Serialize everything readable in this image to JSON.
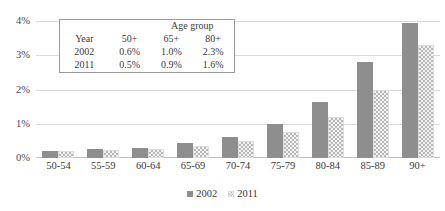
{
  "chart_data": {
    "type": "bar",
    "title": "",
    "xlabel": "",
    "ylabel": "",
    "ylim": [
      0,
      4
    ],
    "ytick_labels": [
      "4%",
      "3%",
      "2%",
      "1%",
      "0%"
    ],
    "ytick_values": [
      4,
      3,
      2,
      1,
      0
    ],
    "grid": true,
    "legend_position": "bottom",
    "categories": [
      "50-54",
      "55-59",
      "60-64",
      "65-69",
      "70-74",
      "75-79",
      "80-84",
      "85-89",
      "90+"
    ],
    "series": [
      {
        "name": "2002",
        "values": [
          0.2,
          0.25,
          0.3,
          0.45,
          0.6,
          1.0,
          1.65,
          2.8,
          3.95
        ]
      },
      {
        "name": "2011",
        "values": [
          0.2,
          0.22,
          0.25,
          0.35,
          0.5,
          0.75,
          1.2,
          2.0,
          3.3
        ]
      }
    ]
  },
  "inset_table": {
    "group_header": "Age group",
    "columns": [
      "Year",
      "50+",
      "65+",
      "80+"
    ],
    "rows": [
      {
        "year": "2002",
        "c50": "0.6%",
        "c65": "1.0%",
        "c80": "2.3%"
      },
      {
        "year": "2011",
        "c50": "0.5%",
        "c65": "0.9%",
        "c80": "1.6%"
      }
    ]
  },
  "colors": {
    "series_2002": "#8e8e8e",
    "series_2011": "#b8b8b8",
    "gridline": "#d9d9d9",
    "text": "#3a3a3a"
  }
}
